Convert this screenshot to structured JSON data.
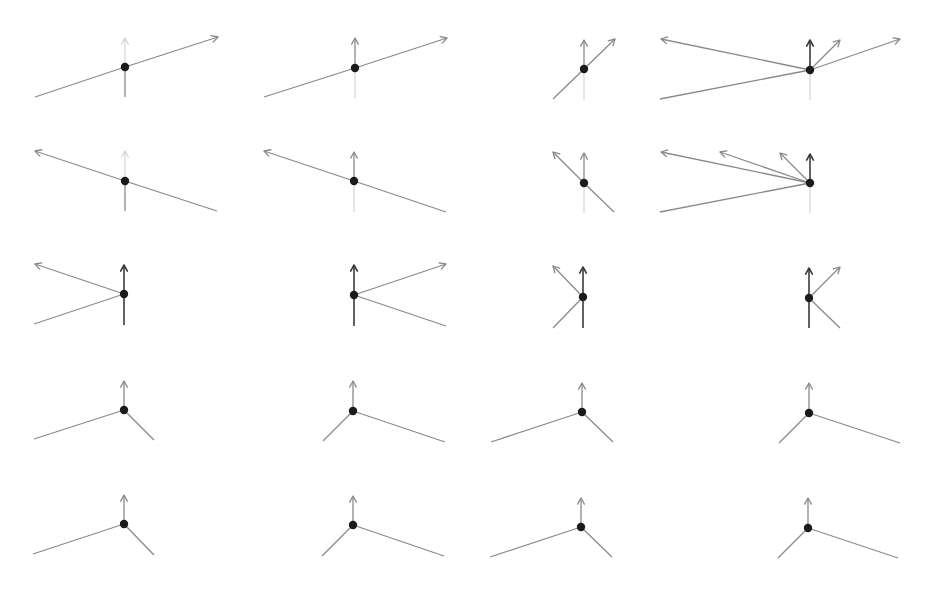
{
  "figure": {
    "title": "",
    "colors": {
      "dark": "#3a3a3a",
      "mid": "#8a8a8a",
      "faint": "#cfcfcf",
      "dot": "#1b1b1b",
      "background": "#ffffff"
    },
    "dot_radius": 4.2,
    "arrowhead_size": 7,
    "rows": 5,
    "cols": 4
  },
  "diagrams": [
    {
      "id": "r1c1",
      "row": 1,
      "col": 1,
      "vertex": [
        125,
        67
      ],
      "rays": [
        {
          "to": [
            218,
            37
          ],
          "arrow": true,
          "tone": "mid"
        },
        {
          "to": [
            35,
            97
          ],
          "arrow": false,
          "tone": "mid"
        },
        {
          "to": [
            125,
            38
          ],
          "arrow": true,
          "tone": "faint"
        },
        {
          "to": [
            125,
            97
          ],
          "arrow": false,
          "tone": "mid"
        }
      ]
    },
    {
      "id": "r1c2",
      "row": 1,
      "col": 2,
      "vertex": [
        355,
        68
      ],
      "rays": [
        {
          "to": [
            447,
            38
          ],
          "arrow": true,
          "tone": "mid"
        },
        {
          "to": [
            264,
            97
          ],
          "arrow": false,
          "tone": "mid"
        },
        {
          "to": [
            355,
            38
          ],
          "arrow": true,
          "tone": "mid"
        },
        {
          "to": [
            355,
            98
          ],
          "arrow": false,
          "tone": "faint"
        }
      ]
    },
    {
      "id": "r1c3",
      "row": 1,
      "col": 3,
      "vertex": [
        584,
        69
      ],
      "rays": [
        {
          "to": [
            615,
            39
          ],
          "arrow": true,
          "tone": "mid"
        },
        {
          "to": [
            553,
            99
          ],
          "arrow": false,
          "tone": "mid"
        },
        {
          "to": [
            584,
            40
          ],
          "arrow": true,
          "tone": "mid"
        },
        {
          "to": [
            584,
            100
          ],
          "arrow": false,
          "tone": "faint"
        }
      ]
    },
    {
      "id": "r1c4",
      "row": 1,
      "col": 4,
      "vertex": [
        810,
        70
      ],
      "rays": [
        {
          "to": [
            810,
            40
          ],
          "arrow": true,
          "tone": "dark"
        },
        {
          "to": [
            840,
            40
          ],
          "arrow": true,
          "tone": "mid"
        },
        {
          "to": [
            900,
            39
          ],
          "arrow": true,
          "tone": "mid"
        },
        {
          "to": [
            661,
            39
          ],
          "arrow": true,
          "tone": "mid"
        },
        {
          "to": [
            660,
            99
          ],
          "arrow": false,
          "tone": "mid"
        },
        {
          "to": [
            810,
            100
          ],
          "arrow": false,
          "tone": "faint"
        }
      ]
    },
    {
      "id": "r2c1",
      "row": 2,
      "col": 1,
      "vertex": [
        125,
        181
      ],
      "rays": [
        {
          "to": [
            35,
            151
          ],
          "arrow": true,
          "tone": "mid"
        },
        {
          "to": [
            217,
            211
          ],
          "arrow": false,
          "tone": "mid"
        },
        {
          "to": [
            125,
            151
          ],
          "arrow": true,
          "tone": "faint"
        },
        {
          "to": [
            125,
            211
          ],
          "arrow": false,
          "tone": "mid"
        }
      ]
    },
    {
      "id": "r2c2",
      "row": 2,
      "col": 2,
      "vertex": [
        354,
        181
      ],
      "rays": [
        {
          "to": [
            264,
            151
          ],
          "arrow": true,
          "tone": "mid"
        },
        {
          "to": [
            446,
            212
          ],
          "arrow": false,
          "tone": "mid"
        },
        {
          "to": [
            354,
            152
          ],
          "arrow": true,
          "tone": "mid"
        },
        {
          "to": [
            354,
            212
          ],
          "arrow": false,
          "tone": "faint"
        }
      ]
    },
    {
      "id": "r2c3",
      "row": 2,
      "col": 3,
      "vertex": [
        584,
        183
      ],
      "rays": [
        {
          "to": [
            553,
            152
          ],
          "arrow": true,
          "tone": "mid"
        },
        {
          "to": [
            614,
            212
          ],
          "arrow": false,
          "tone": "mid"
        },
        {
          "to": [
            584,
            153
          ],
          "arrow": true,
          "tone": "mid"
        },
        {
          "to": [
            584,
            213
          ],
          "arrow": false,
          "tone": "faint"
        }
      ]
    },
    {
      "id": "r2c4",
      "row": 2,
      "col": 4,
      "vertex": [
        810,
        183
      ],
      "rays": [
        {
          "to": [
            810,
            154
          ],
          "arrow": true,
          "tone": "dark"
        },
        {
          "to": [
            780,
            153
          ],
          "arrow": true,
          "tone": "mid"
        },
        {
          "to": [
            720,
            152
          ],
          "arrow": true,
          "tone": "mid"
        },
        {
          "to": [
            661,
            152
          ],
          "arrow": true,
          "tone": "mid"
        },
        {
          "to": [
            660,
            212
          ],
          "arrow": false,
          "tone": "mid"
        },
        {
          "to": [
            810,
            213
          ],
          "arrow": false,
          "tone": "faint"
        }
      ]
    },
    {
      "id": "r3c1",
      "row": 3,
      "col": 1,
      "vertex": [
        124,
        294
      ],
      "rays": [
        {
          "to": [
            35,
            264
          ],
          "arrow": true,
          "tone": "mid"
        },
        {
          "to": [
            34,
            324
          ],
          "arrow": false,
          "tone": "mid"
        },
        {
          "to": [
            124,
            265
          ],
          "arrow": true,
          "tone": "dark"
        },
        {
          "to": [
            124,
            325
          ],
          "arrow": false,
          "tone": "dark"
        }
      ]
    },
    {
      "id": "r3c2",
      "row": 3,
      "col": 2,
      "vertex": [
        354,
        295
      ],
      "rays": [
        {
          "to": [
            446,
            264
          ],
          "arrow": true,
          "tone": "mid"
        },
        {
          "to": [
            446,
            326
          ],
          "arrow": false,
          "tone": "mid"
        },
        {
          "to": [
            354,
            265
          ],
          "arrow": true,
          "tone": "dark"
        },
        {
          "to": [
            354,
            326
          ],
          "arrow": false,
          "tone": "dark"
        }
      ]
    },
    {
      "id": "r3c3",
      "row": 3,
      "col": 3,
      "vertex": [
        583,
        297
      ],
      "rays": [
        {
          "to": [
            553,
            266
          ],
          "arrow": true,
          "tone": "mid"
        },
        {
          "to": [
            553,
            328
          ],
          "arrow": false,
          "tone": "mid"
        },
        {
          "to": [
            583,
            267
          ],
          "arrow": true,
          "tone": "dark"
        },
        {
          "to": [
            583,
            328
          ],
          "arrow": false,
          "tone": "dark"
        }
      ]
    },
    {
      "id": "r3c4",
      "row": 3,
      "col": 4,
      "vertex": [
        809,
        298
      ],
      "rays": [
        {
          "to": [
            840,
            267
          ],
          "arrow": true,
          "tone": "mid"
        },
        {
          "to": [
            840,
            328
          ],
          "arrow": false,
          "tone": "mid"
        },
        {
          "to": [
            809,
            268
          ],
          "arrow": true,
          "tone": "dark"
        },
        {
          "to": [
            809,
            328
          ],
          "arrow": false,
          "tone": "dark"
        }
      ]
    },
    {
      "id": "r4c1",
      "row": 4,
      "col": 1,
      "vertex": [
        124,
        410
      ],
      "rays": [
        {
          "to": [
            124,
            381
          ],
          "arrow": true,
          "tone": "mid"
        },
        {
          "to": [
            34,
            439
          ],
          "arrow": false,
          "tone": "mid"
        },
        {
          "to": [
            154,
            440
          ],
          "arrow": false,
          "tone": "mid"
        }
      ]
    },
    {
      "id": "r4c2",
      "row": 4,
      "col": 2,
      "vertex": [
        353,
        411
      ],
      "rays": [
        {
          "to": [
            353,
            381
          ],
          "arrow": true,
          "tone": "mid"
        },
        {
          "to": [
            323,
            441
          ],
          "arrow": false,
          "tone": "mid"
        },
        {
          "to": [
            445,
            442
          ],
          "arrow": false,
          "tone": "mid"
        }
      ]
    },
    {
      "id": "r4c3",
      "row": 4,
      "col": 3,
      "vertex": [
        582,
        412
      ],
      "rays": [
        {
          "to": [
            582,
            383
          ],
          "arrow": true,
          "tone": "mid"
        },
        {
          "to": [
            491,
            442
          ],
          "arrow": false,
          "tone": "mid"
        },
        {
          "to": [
            613,
            442
          ],
          "arrow": false,
          "tone": "mid"
        }
      ]
    },
    {
      "id": "r4c4",
      "row": 4,
      "col": 4,
      "vertex": [
        809,
        413
      ],
      "rays": [
        {
          "to": [
            809,
            383
          ],
          "arrow": true,
          "tone": "mid"
        },
        {
          "to": [
            779,
            443
          ],
          "arrow": false,
          "tone": "mid"
        },
        {
          "to": [
            900,
            443
          ],
          "arrow": false,
          "tone": "mid"
        }
      ]
    },
    {
      "id": "r5c1",
      "row": 5,
      "col": 1,
      "vertex": [
        124,
        524
      ],
      "rays": [
        {
          "to": [
            124,
            495
          ],
          "arrow": true,
          "tone": "mid"
        },
        {
          "to": [
            33,
            554
          ],
          "arrow": false,
          "tone": "mid"
        },
        {
          "to": [
            154,
            555
          ],
          "arrow": false,
          "tone": "mid"
        }
      ]
    },
    {
      "id": "r5c2",
      "row": 5,
      "col": 2,
      "vertex": [
        353,
        525
      ],
      "rays": [
        {
          "to": [
            353,
            496
          ],
          "arrow": true,
          "tone": "mid"
        },
        {
          "to": [
            322,
            556
          ],
          "arrow": false,
          "tone": "mid"
        },
        {
          "to": [
            444,
            556
          ],
          "arrow": false,
          "tone": "mid"
        }
      ]
    },
    {
      "id": "r5c3",
      "row": 5,
      "col": 3,
      "vertex": [
        581,
        527
      ],
      "rays": [
        {
          "to": [
            581,
            498
          ],
          "arrow": true,
          "tone": "mid"
        },
        {
          "to": [
            490,
            557
          ],
          "arrow": false,
          "tone": "mid"
        },
        {
          "to": [
            612,
            557
          ],
          "arrow": false,
          "tone": "mid"
        }
      ]
    },
    {
      "id": "r5c4",
      "row": 5,
      "col": 4,
      "vertex": [
        808,
        528
      ],
      "rays": [
        {
          "to": [
            808,
            498
          ],
          "arrow": true,
          "tone": "mid"
        },
        {
          "to": [
            778,
            558
          ],
          "arrow": false,
          "tone": "mid"
        },
        {
          "to": [
            898,
            558
          ],
          "arrow": false,
          "tone": "mid"
        }
      ]
    }
  ]
}
